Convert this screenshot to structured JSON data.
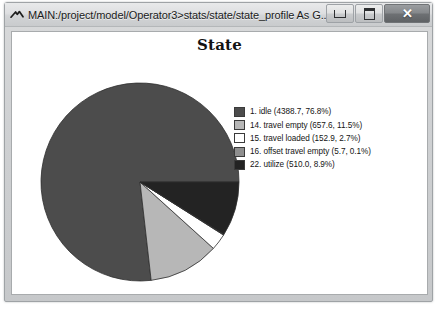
{
  "window": {
    "title": "MAIN:/project/model/Operator3>stats/state/state_profile As G...",
    "app_icon": "caret-logo-icon",
    "buttons": {
      "minimize": "minimize-icon",
      "maximize": "maximize-icon",
      "close": "✕"
    }
  },
  "chart": {
    "title": "State"
  },
  "chart_data": {
    "type": "pie",
    "title": "State",
    "legend_position": "right",
    "value_label_format": "(value, percent)",
    "labels": [
      "1. idle",
      "14. travel empty",
      "15. travel loaded",
      "16. offset travel empty",
      "22. utilize"
    ],
    "values": [
      4388.7,
      657.6,
      152.9,
      5.7,
      510.0
    ],
    "percents": [
      76.8,
      11.5,
      2.7,
      0.1,
      8.9
    ],
    "colors": [
      "#4c4c4c",
      "#b7b7b7",
      "#ffffff",
      "#8e8e8e",
      "#232323"
    ],
    "legend_entries": [
      "1. idle (4388.7, 76.8%)",
      "14. travel empty (657.6, 11.5%)",
      "15. travel loaded (152.9, 2.7%)",
      "16. offset travel empty (5.7, 0.1%)",
      "22. utilize (510.0, 8.9%)"
    ]
  }
}
